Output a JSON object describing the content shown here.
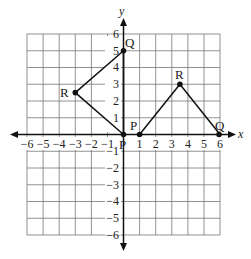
{
  "diagram": {
    "axes": {
      "x_label": "x",
      "y_label": "y",
      "x_ticks": [
        "−6",
        "−5",
        "−4",
        "−3",
        "−2",
        "−1",
        "1",
        "2",
        "3",
        "4",
        "5",
        "6"
      ],
      "y_ticks_positive": [
        "1",
        "2",
        "3",
        "4",
        "5",
        "6"
      ],
      "y_ticks_negative": [
        "−1",
        "−2",
        "−3",
        "−4",
        "−5",
        "−6"
      ],
      "range": {
        "x": [
          -6,
          6
        ],
        "y": [
          -6,
          6
        ]
      }
    },
    "triangle_left": {
      "vertices": [
        {
          "name": "P",
          "x": 0,
          "y": 0
        },
        {
          "name": "Q",
          "x": 0,
          "y": 5
        },
        {
          "name": "R",
          "x": -3,
          "y": 2.5
        }
      ]
    },
    "triangle_right": {
      "vertices": [
        {
          "name": "P",
          "x": 1,
          "y": 0
        },
        {
          "name": "Q",
          "x": 6,
          "y": 0
        },
        {
          "name": "R",
          "x": 3.5,
          "y": 3
        }
      ]
    },
    "labels": {
      "left_P": "P",
      "left_Q": "Q",
      "left_R": "R",
      "right_P": "P",
      "right_Q": "Q",
      "right_R": "R"
    }
  }
}
